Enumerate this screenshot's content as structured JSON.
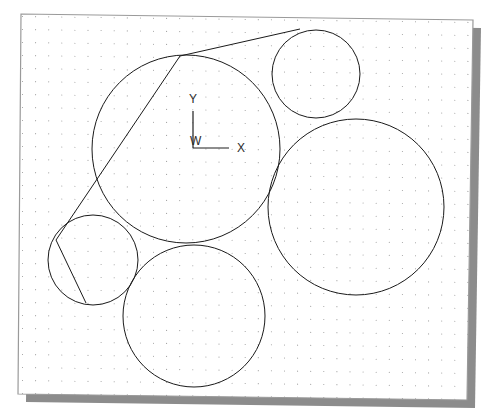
{
  "document": {
    "title": "Tangent Circles Construction",
    "canvas_background": "#ffffff",
    "page_background": "#ffffff"
  },
  "drawing_frame": {
    "name": "drawing-sheet",
    "border_color": "#9a9a9a",
    "shadow_color": "#8c8c8c",
    "corners": {
      "top_left": {
        "x": 21,
        "y": 14
      },
      "top_right": {
        "x": 473,
        "y": 20
      },
      "bottom_right": {
        "x": 467,
        "y": 400
      },
      "bottom_left": {
        "x": 18,
        "y": 394
      }
    },
    "shadow_offset": {
      "x": 8,
      "y": 8
    }
  },
  "grid": {
    "name": "dot-grid",
    "dot_color": "#9b9b9b",
    "spacing_x": 13.1,
    "spacing_y": 13.0,
    "origin": {
      "x": 22.5,
      "y": 16.5
    },
    "columns": 35,
    "rows": 30,
    "dot_radius": 0.55,
    "visible": true
  },
  "coordinate_system": {
    "name": "wcs-triad",
    "origin_label": "W",
    "x_axis_label": "X",
    "y_axis_label": "Y",
    "origin_point": {
      "x": 193,
      "y": 148
    },
    "x_axis_end": {
      "x": 229,
      "y": 148
    },
    "y_axis_end": {
      "x": 193,
      "y": 111
    },
    "color": "#1f1f1f",
    "label_font_size": 12
  },
  "geometry": {
    "stroke_color": "#1a1a1a",
    "stroke_width": 1.0,
    "fill": "none",
    "circles": [
      {
        "id": "circle-main-large",
        "label": "Large central circle",
        "cx": 186,
        "cy": 149,
        "r": 94
      },
      {
        "id": "circle-top-right-small",
        "label": "Upper right small circle",
        "cx": 316,
        "cy": 74,
        "r": 44
      },
      {
        "id": "circle-right-large",
        "label": "Right large circle",
        "cx": 356,
        "cy": 207,
        "r": 88
      },
      {
        "id": "circle-bottom-left-small",
        "label": "Lower left small circle",
        "cx": 93,
        "cy": 260,
        "r": 45
      },
      {
        "id": "circle-bottom-center",
        "label": "Lower center circle",
        "cx": 194,
        "cy": 316,
        "r": 71
      }
    ],
    "tangent_lines": [
      {
        "id": "tangent-top-right",
        "label": "Tangent from large circle to upper right circle",
        "x1": 180,
        "y1": 56,
        "x2": 300,
        "y2": 29
      },
      {
        "id": "tangent-left",
        "label": "Tangent from large circle to lower left circle",
        "x1": 180,
        "y1": 56,
        "x2": 56,
        "y2": 240
      },
      {
        "id": "tangent-left-lower",
        "label": "Tangent continuation below lower left circle",
        "x1": 56,
        "y1": 240,
        "x2": 86,
        "y2": 303
      }
    ]
  }
}
